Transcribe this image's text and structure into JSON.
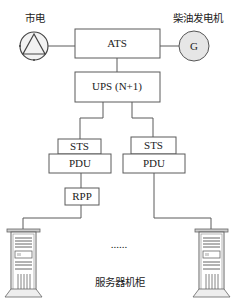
{
  "diagram": {
    "sources": {
      "grid_label": "市电",
      "generator_label": "柴油发电机",
      "generator_symbol": "G"
    },
    "ats": {
      "label": "ATS"
    },
    "ups": {
      "label": "UPS (N+1)"
    },
    "left_branch": {
      "sts": "STS",
      "pdu": "PDU",
      "rpp": "RPP"
    },
    "right_branch": {
      "sts": "STS",
      "pdu": "PDU"
    },
    "ellipsis": "......",
    "rack_label": "服务器机柜",
    "icons": [
      "grid-source-icon",
      "generator-icon",
      "server-rack-icon",
      "server-rack-icon"
    ],
    "colors": {
      "line": "#5a5a5a",
      "text": "#222222",
      "generator_fill": "#e6e6e6"
    }
  }
}
